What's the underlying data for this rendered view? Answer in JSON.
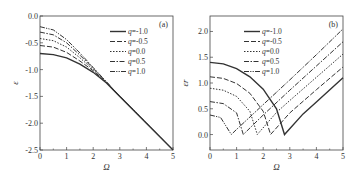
{
  "chart_data": [
    {
      "type": "line",
      "panel_label": "(a)",
      "xlabel": "Ω",
      "ylabel": "ε",
      "xlim": [
        0,
        5
      ],
      "ylim": [
        -2.5,
        0.0
      ],
      "xticks": [
        "0",
        "1",
        "2",
        "3",
        "4",
        "5"
      ],
      "yticks": [
        "0.0",
        "-0.5",
        "-1.0",
        "-1.5",
        "-2.0",
        "-2.5"
      ],
      "legend": [
        "q=-1.0",
        "q=-0.5",
        "q=0.0",
        "q=0.5",
        "q=1.0"
      ],
      "series": [
        {
          "name": "q=-1.0",
          "style": "solid",
          "x": [
            0,
            0.5,
            1,
            1.5,
            2,
            2.5,
            3,
            4,
            5
          ],
          "y": [
            -0.7,
            -0.72,
            -0.78,
            -0.9,
            -1.05,
            -1.25,
            -1.5,
            -2.0,
            -2.5
          ]
        },
        {
          "name": "q=-0.5",
          "style": "dash",
          "x": [
            0,
            0.5,
            1,
            1.5,
            2,
            2.5,
            3,
            4,
            5
          ],
          "y": [
            -0.55,
            -0.58,
            -0.68,
            -0.84,
            -1.02,
            -1.24,
            -1.5,
            -2.0,
            -2.5
          ]
        },
        {
          "name": "q=0.0",
          "style": "dot",
          "x": [
            0,
            0.5,
            1,
            1.5,
            2,
            2.5,
            3,
            4,
            5
          ],
          "y": [
            -0.42,
            -0.46,
            -0.58,
            -0.78,
            -1.0,
            -1.24,
            -1.5,
            -2.0,
            -2.5
          ]
        },
        {
          "name": "q=0.5",
          "style": "dashdot",
          "x": [
            0,
            0.5,
            1,
            1.5,
            2,
            2.5,
            3,
            4,
            5
          ],
          "y": [
            -0.3,
            -0.35,
            -0.5,
            -0.73,
            -0.98,
            -1.23,
            -1.5,
            -2.0,
            -2.5
          ]
        },
        {
          "name": "q=1.0",
          "style": "dashdotdot",
          "x": [
            0,
            0.5,
            1,
            1.5,
            2,
            2.5,
            3,
            4,
            5
          ],
          "y": [
            -0.2,
            -0.26,
            -0.44,
            -0.69,
            -0.96,
            -1.23,
            -1.5,
            -2.0,
            -2.5
          ]
        }
      ]
    },
    {
      "type": "line",
      "panel_label": "(b)",
      "xlabel": "Ω",
      "ylabel": "εr",
      "xlim": [
        0,
        5
      ],
      "ylim": [
        -0.3,
        2.3
      ],
      "xticks": [
        "0",
        "1",
        "2",
        "3",
        "4",
        "5"
      ],
      "yticks": [
        "0.0",
        "0.5",
        "1.0",
        "1.5",
        "2.0"
      ],
      "legend": [
        "q=-1.0",
        "q=-0.5",
        "q=0.0",
        "q=0.5",
        "q=1.0"
      ],
      "series": [
        {
          "name": "q=-1.0",
          "style": "solid",
          "x": [
            0,
            0.5,
            1,
            1.5,
            2,
            2.5,
            2.8,
            3.5,
            4,
            5
          ],
          "y": [
            1.4,
            1.37,
            1.28,
            1.12,
            0.88,
            0.5,
            0.0,
            0.4,
            0.63,
            1.1
          ]
        },
        {
          "name": "q=-0.5",
          "style": "dash",
          "x": [
            0,
            0.5,
            1,
            1.5,
            2,
            2.28,
            3,
            4,
            5
          ],
          "y": [
            1.12,
            1.09,
            0.99,
            0.8,
            0.45,
            0.0,
            0.42,
            0.87,
            1.31
          ]
        },
        {
          "name": "q=0.0",
          "style": "dot",
          "x": [
            0,
            0.5,
            1,
            1.5,
            1.78,
            2.5,
            3,
            4,
            5
          ],
          "y": [
            0.9,
            0.86,
            0.74,
            0.45,
            0.0,
            0.43,
            0.66,
            1.11,
            1.56
          ]
        },
        {
          "name": "q=0.5",
          "style": "dashdot",
          "x": [
            0,
            0.5,
            1,
            1.25,
            2,
            3,
            4,
            5
          ],
          "y": [
            0.64,
            0.6,
            0.42,
            0.0,
            0.38,
            0.86,
            1.33,
            1.8
          ]
        },
        {
          "name": "q=1.0",
          "style": "dashdotdot",
          "x": [
            0,
            0.4,
            0.8,
            1,
            2,
            3,
            4,
            5
          ],
          "y": [
            0.38,
            0.33,
            0.0,
            0.1,
            0.58,
            1.06,
            1.55,
            2.05
          ]
        }
      ]
    }
  ]
}
